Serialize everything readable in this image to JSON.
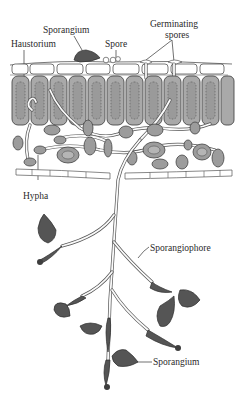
{
  "figure": {
    "type": "biological-diagram",
    "labels": {
      "sporangium_top": "Sporangium",
      "spore": "Spore",
      "germinating_spores": [
        "Germinating",
        "spores"
      ],
      "haustorium": "Haustorium",
      "hypha": "Hypha",
      "sporangiophore": "Sporangiophore",
      "sporangium_bottom": "Sporangium"
    },
    "colors": {
      "background": "#ffffff",
      "cell_fill": "#a9a9a9",
      "sporangium_fill": "#555555",
      "outline": "#333333"
    }
  }
}
